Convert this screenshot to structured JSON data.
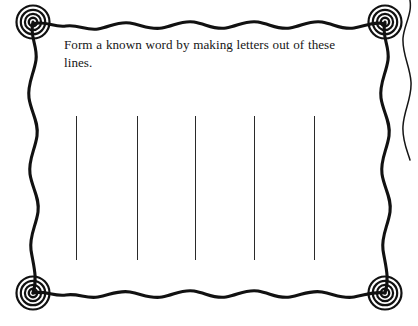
{
  "page": {
    "kind": "worksheet-activity-card",
    "background_color": "#ffffff",
    "ink_color": "#111111",
    "width": 418,
    "height": 326
  },
  "prompt": {
    "text": "Form a known word by making letters out of these lines.",
    "line_1": "Form a known word by making letters out",
    "line_2": "of these lines.",
    "color": "#161616"
  },
  "frame": {
    "style": "hand-drawn-wavy-border",
    "color": "#111111",
    "left": 33,
    "top": 22,
    "right": 385,
    "bottom": 293,
    "corner_ornament": {
      "name": "concentric-circles",
      "count": 4,
      "ring_count": 4,
      "diameter": 34,
      "color": "#111111"
    },
    "corner_positions": [
      {
        "name": "top-left",
        "cx": 33,
        "cy": 22
      },
      {
        "name": "top-right",
        "cx": 385,
        "cy": 22
      },
      {
        "name": "bottom-left",
        "cx": 33,
        "cy": 293
      },
      {
        "name": "bottom-right",
        "cx": 385,
        "cy": 293
      }
    ],
    "adjacent_edge": {
      "name": "partial-neighbor-frame-edge",
      "x_range": [
        398,
        416
      ],
      "y_range": [
        0,
        160
      ]
    }
  },
  "answer_lines": {
    "count": 5,
    "color": "#2a2a2a",
    "thickness": 1,
    "top": 116,
    "bottom": 260,
    "height": 144,
    "x_positions": [
      76,
      137,
      195,
      254,
      314
    ]
  }
}
